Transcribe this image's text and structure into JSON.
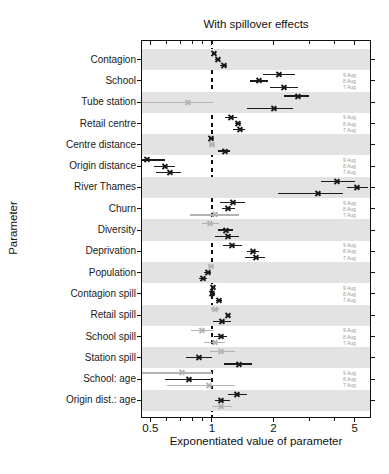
{
  "colors": {
    "band": "#e3e3e3",
    "dark_series": "#1b1b1b",
    "light_series": "#b3b3b3",
    "aug_label_text": "#999999",
    "axis": "#111111"
  },
  "chart_data": {
    "type": "forest",
    "title": "With spillover effects",
    "xlabel": "Exponentiated value of parameter",
    "ylabel": "Parameter",
    "x_scale": "log",
    "x_range": [
      0.45,
      6.0
    ],
    "x_major_ticks": [
      0.5,
      1,
      2,
      5
    ],
    "x_major_tick_labels": [
      "0.5",
      "1",
      "2",
      "5"
    ],
    "x_minor_ticks": [
      0.6,
      0.7,
      0.8,
      0.9,
      3,
      4,
      6
    ],
    "reference_line": 1,
    "series_labels": [
      "9 Aug",
      "8 Aug",
      "7 Aug"
    ],
    "legend_note": "date labels repeated beside unshaded rows",
    "parameters": [
      {
        "name": "Contagion",
        "shaded": true,
        "estimates": [
          {
            "date": "9 Aug",
            "value": 1.02,
            "lo": 1.0,
            "hi": 1.05,
            "tone": "dark"
          },
          {
            "date": "8 Aug",
            "value": 1.07,
            "lo": 1.04,
            "hi": 1.1,
            "tone": "dark"
          },
          {
            "date": "7 Aug",
            "value": 1.14,
            "lo": 1.1,
            "hi": 1.18,
            "tone": "dark"
          }
        ]
      },
      {
        "name": "School",
        "shaded": false,
        "estimates": [
          {
            "date": "9 Aug",
            "value": 2.11,
            "lo": 1.78,
            "hi": 2.56,
            "tone": "dark"
          },
          {
            "date": "8 Aug",
            "value": 1.7,
            "lo": 1.54,
            "hi": 1.89,
            "tone": "dark"
          },
          {
            "date": "7 Aug",
            "value": 2.24,
            "lo": 1.93,
            "hi": 2.65,
            "tone": "dark"
          }
        ]
      },
      {
        "name": "Tube station",
        "shaded": true,
        "estimates": [
          {
            "date": "9 Aug",
            "value": 2.62,
            "lo": 2.24,
            "hi": 2.97,
            "tone": "dark"
          },
          {
            "date": "8 Aug",
            "value": 0.76,
            "lo": 0.45,
            "hi": 1.01,
            "tone": "light"
          },
          {
            "date": "7 Aug",
            "value": 2.0,
            "lo": 1.49,
            "hi": 2.48,
            "tone": "dark"
          }
        ]
      },
      {
        "name": "Retail centre",
        "shaded": false,
        "estimates": [
          {
            "date": "9 Aug",
            "value": 1.23,
            "lo": 1.16,
            "hi": 1.33,
            "tone": "dark"
          },
          {
            "date": "8 Aug",
            "value": 1.34,
            "lo": 1.3,
            "hi": 1.39,
            "tone": "dark"
          },
          {
            "date": "7 Aug",
            "value": 1.36,
            "lo": 1.27,
            "hi": 1.45,
            "tone": "dark"
          }
        ]
      },
      {
        "name": "Centre distance",
        "shaded": true,
        "estimates": [
          {
            "date": "9 Aug",
            "value": 0.99,
            "lo": 0.97,
            "hi": 1.02,
            "tone": "dark"
          },
          {
            "date": "8 Aug",
            "value": 1.0,
            "lo": 0.97,
            "hi": 1.04,
            "tone": "light"
          },
          {
            "date": "7 Aug",
            "value": 1.15,
            "lo": 1.07,
            "hi": 1.23,
            "tone": "dark"
          }
        ]
      },
      {
        "name": "Origin distance",
        "shaded": false,
        "estimates": [
          {
            "date": "9 Aug",
            "value": 0.48,
            "lo": 0.44,
            "hi": 0.59,
            "tone": "dark"
          },
          {
            "date": "8 Aug",
            "value": 0.59,
            "lo": 0.52,
            "hi": 0.66,
            "tone": "dark"
          },
          {
            "date": "7 Aug",
            "value": 0.62,
            "lo": 0.53,
            "hi": 0.71,
            "tone": "dark"
          }
        ]
      },
      {
        "name": "River Thames",
        "shaded": true,
        "estimates": [
          {
            "date": "9 Aug",
            "value": 4.1,
            "lo": 3.4,
            "hi": 5.0,
            "tone": "dark"
          },
          {
            "date": "8 Aug",
            "value": 5.1,
            "lo": 4.6,
            "hi": 5.8,
            "tone": "dark"
          },
          {
            "date": "7 Aug",
            "value": 3.3,
            "lo": 2.1,
            "hi": 4.4,
            "tone": "dark"
          }
        ]
      },
      {
        "name": "Churn",
        "shaded": false,
        "estimates": [
          {
            "date": "9 Aug",
            "value": 1.27,
            "lo": 1.1,
            "hi": 1.45,
            "tone": "dark"
          },
          {
            "date": "8 Aug",
            "value": 1.2,
            "lo": 1.12,
            "hi": 1.3,
            "tone": "dark"
          },
          {
            "date": "7 Aug",
            "value": 1.03,
            "lo": 0.78,
            "hi": 1.35,
            "tone": "light"
          }
        ]
      },
      {
        "name": "Diversity",
        "shaded": true,
        "estimates": [
          {
            "date": "9 Aug",
            "value": 0.98,
            "lo": 0.89,
            "hi": 1.08,
            "tone": "light"
          },
          {
            "date": "8 Aug",
            "value": 1.17,
            "lo": 1.07,
            "hi": 1.27,
            "tone": "dark"
          },
          {
            "date": "7 Aug",
            "value": 1.19,
            "lo": 1.03,
            "hi": 1.35,
            "tone": "dark"
          }
        ]
      },
      {
        "name": "Deprivation",
        "shaded": false,
        "estimates": [
          {
            "date": "9 Aug",
            "value": 1.25,
            "lo": 1.13,
            "hi": 1.4,
            "tone": "dark"
          },
          {
            "date": "8 Aug",
            "value": 1.58,
            "lo": 1.48,
            "hi": 1.7,
            "tone": "dark"
          },
          {
            "date": "7 Aug",
            "value": 1.63,
            "lo": 1.45,
            "hi": 1.82,
            "tone": "dark"
          }
        ]
      },
      {
        "name": "Population",
        "shaded": true,
        "estimates": [
          {
            "date": "9 Aug",
            "value": 0.99,
            "lo": 0.96,
            "hi": 1.02,
            "tone": "light"
          },
          {
            "date": "8 Aug",
            "value": 0.95,
            "lo": 0.92,
            "hi": 0.99,
            "tone": "dark"
          },
          {
            "date": "7 Aug",
            "value": 0.9,
            "lo": 0.86,
            "hi": 0.95,
            "tone": "dark"
          }
        ]
      },
      {
        "name": "Contagion spill",
        "shaded": false,
        "estimates": [
          {
            "date": "9 Aug",
            "value": 1.01,
            "lo": 0.99,
            "hi": 1.03,
            "tone": "dark"
          },
          {
            "date": "8 Aug",
            "value": 1.0,
            "lo": 0.98,
            "hi": 1.03,
            "tone": "dark"
          },
          {
            "date": "7 Aug",
            "value": 1.08,
            "lo": 1.05,
            "hi": 1.12,
            "tone": "dark"
          }
        ]
      },
      {
        "name": "Retail spill",
        "shaded": true,
        "estimates": [
          {
            "date": "9 Aug",
            "value": 1.03,
            "lo": 0.99,
            "hi": 1.08,
            "tone": "light"
          },
          {
            "date": "8 Aug",
            "value": 1.2,
            "lo": 1.17,
            "hi": 1.23,
            "tone": "dark"
          },
          {
            "date": "7 Aug",
            "value": 1.12,
            "lo": 1.01,
            "hi": 1.24,
            "tone": "dark"
          }
        ]
      },
      {
        "name": "School spill",
        "shaded": false,
        "estimates": [
          {
            "date": "9 Aug",
            "value": 0.89,
            "lo": 0.79,
            "hi": 1.02,
            "tone": "light"
          },
          {
            "date": "8 Aug",
            "value": 1.1,
            "lo": 1.02,
            "hi": 1.18,
            "tone": "dark"
          },
          {
            "date": "7 Aug",
            "value": 1.03,
            "lo": 0.91,
            "hi": 1.16,
            "tone": "light"
          }
        ]
      },
      {
        "name": "Station spill",
        "shaded": true,
        "estimates": [
          {
            "date": "9 Aug",
            "value": 1.1,
            "lo": 0.98,
            "hi": 1.3,
            "tone": "light"
          },
          {
            "date": "8 Aug",
            "value": 0.86,
            "lo": 0.75,
            "hi": 1.0,
            "tone": "dark"
          },
          {
            "date": "7 Aug",
            "value": 1.35,
            "lo": 1.14,
            "hi": 1.57,
            "tone": "dark"
          }
        ]
      },
      {
        "name": "School: age",
        "shaded": false,
        "estimates": [
          {
            "date": "9 Aug",
            "value": 0.71,
            "lo": 0.45,
            "hi": 1.0,
            "tone": "light"
          },
          {
            "date": "8 Aug",
            "value": 0.77,
            "lo": 0.59,
            "hi": 1.0,
            "tone": "dark"
          },
          {
            "date": "7 Aug",
            "value": 0.96,
            "lo": 0.6,
            "hi": 1.3,
            "tone": "light"
          }
        ]
      },
      {
        "name": "Origin dist.: age",
        "shaded": true,
        "estimates": [
          {
            "date": "9 Aug",
            "value": 1.32,
            "lo": 1.2,
            "hi": 1.48,
            "tone": "dark"
          },
          {
            "date": "8 Aug",
            "value": 1.11,
            "lo": 1.03,
            "hi": 1.23,
            "tone": "dark"
          },
          {
            "date": "7 Aug",
            "value": 1.1,
            "lo": 1.0,
            "hi": 1.25,
            "tone": "light"
          }
        ]
      }
    ]
  }
}
